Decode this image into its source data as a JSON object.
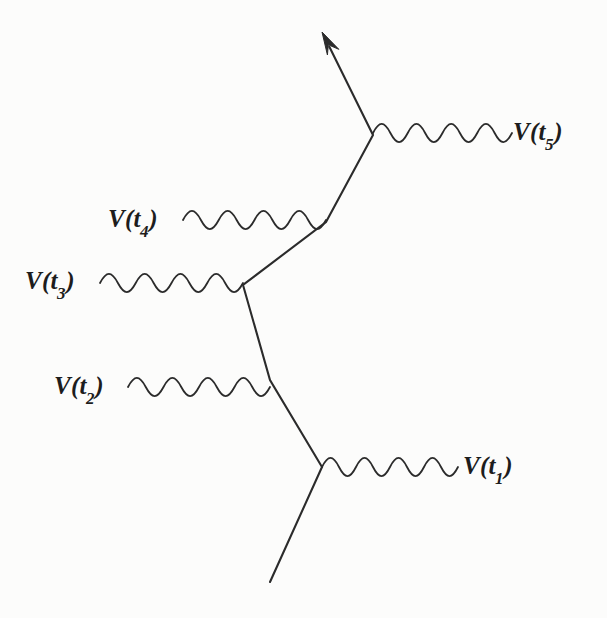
{
  "figure": {
    "kind": "feynman-diagram",
    "background_color": "#fcfcfb",
    "ink_color": "#2b2b2b",
    "width": 607,
    "height": 618
  },
  "labels": [
    {
      "id": "t5",
      "symbol": "V",
      "open": "(",
      "base": "t",
      "sub": "5",
      "close": ")",
      "text": "V(t5)",
      "x": 513,
      "y": 119
    },
    {
      "id": "t4",
      "symbol": "V",
      "open": "(",
      "base": "t",
      "sub": "4",
      "close": ")",
      "text": "V(t4)",
      "x": 108,
      "y": 206
    },
    {
      "id": "t3",
      "symbol": "V",
      "open": "(",
      "base": "t",
      "sub": "3",
      "close": ")",
      "text": "V(t3)",
      "x": 25,
      "y": 268
    },
    {
      "id": "t2",
      "symbol": "V",
      "open": "(",
      "base": "t",
      "sub": "2",
      "close": ")",
      "text": "V(t2)",
      "x": 54,
      "y": 373
    },
    {
      "id": "t1",
      "symbol": "V",
      "open": "(",
      "base": "t",
      "sub": "1",
      "close": ")",
      "text": "V(t1)",
      "x": 463,
      "y": 453
    }
  ],
  "vertices": [
    {
      "id": "v1",
      "label": "V(t1)",
      "x": 322,
      "y": 467
    },
    {
      "id": "v2",
      "label": "V(t2)",
      "x": 270,
      "y": 380
    },
    {
      "id": "v3",
      "label": "V(t3)",
      "x": 243,
      "y": 285
    },
    {
      "id": "v4",
      "label": "V(t4)",
      "x": 326,
      "y": 222
    },
    {
      "id": "v5",
      "label": "V(t5)",
      "x": 373,
      "y": 135
    }
  ],
  "fermion_line": {
    "name": "fermion-propagator",
    "points": [
      [
        270,
        582
      ],
      [
        322,
        467
      ],
      [
        270,
        380
      ],
      [
        243,
        285
      ],
      [
        326,
        222
      ],
      [
        373,
        135
      ],
      [
        322,
        32
      ]
    ],
    "has_arrow_head": true,
    "arrow_tip": [
      322,
      32
    ],
    "stroke_width": 2.1
  },
  "photon_lines": [
    {
      "id": "w1",
      "label": "V(t1)",
      "x_start": 322,
      "x_end": 458,
      "y": 467,
      "direction": "right",
      "amplitude": 9,
      "period": 34,
      "stroke_width": 1.8
    },
    {
      "id": "w2",
      "label": "V(t2)",
      "x_start": 128,
      "x_end": 270,
      "y": 387,
      "direction": "left",
      "amplitude": 9,
      "period": 35.5,
      "stroke_width": 1.8
    },
    {
      "id": "w3",
      "label": "V(t3)",
      "x_start": 100,
      "x_end": 243,
      "y": 283,
      "direction": "left",
      "amplitude": 9,
      "period": 35.8,
      "stroke_width": 1.8
    },
    {
      "id": "w4",
      "label": "V(t4)",
      "x_start": 183,
      "x_end": 326,
      "y": 220,
      "direction": "left",
      "amplitude": 9,
      "period": 35.8,
      "stroke_width": 1.8
    },
    {
      "id": "w5",
      "label": "V(t5)",
      "x_start": 373,
      "x_end": 512,
      "y": 133,
      "direction": "right",
      "amplitude": 9,
      "period": 34.8,
      "stroke_width": 1.8
    }
  ]
}
